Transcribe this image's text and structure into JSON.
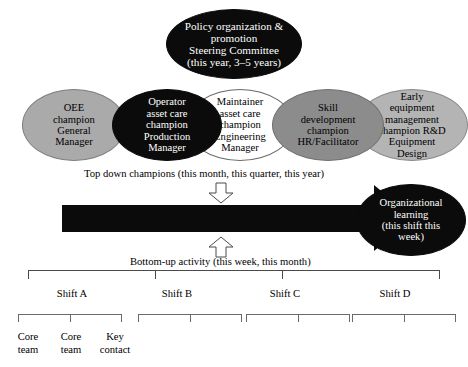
{
  "diagram": {
    "title_ellipse": {
      "label": "Policy organization & promotion Steering Committee (this year, 3–5 years)",
      "lines": [
        "Policy organization &",
        "promotion",
        "Steering Committee",
        "(this year, 3–5 years)"
      ],
      "fill": "#0b0b0b",
      "text_color": "#ffffff"
    },
    "champions": [
      {
        "name": "oee-champion",
        "lines": [
          "OEE",
          "champion",
          "General",
          "Manager"
        ],
        "fill": "#aaaaaa",
        "text_color": "#000000"
      },
      {
        "name": "operator-asset-care-champion",
        "lines": [
          "Operator",
          "asset care",
          "champion",
          "Production",
          "Manager"
        ],
        "fill": "#0b0b0b",
        "text_color": "#ffffff"
      },
      {
        "name": "maintainer-asset-care-champion",
        "lines": [
          "Maintainer",
          "asset care",
          "champion",
          "Engineering",
          "Manager"
        ],
        "fill": "#ffffff",
        "text_color": "#000000"
      },
      {
        "name": "skill-development-champion",
        "lines": [
          "Skill",
          "development",
          "champion",
          "HR/Facilitator"
        ],
        "fill": "#8c8c8c",
        "text_color": "#000000"
      },
      {
        "name": "early-equipment-management-champion",
        "lines": [
          "Early",
          "equipment",
          "management",
          "champion R&D",
          "Equipment",
          "Design"
        ],
        "fill": "#b4b4b4",
        "text_color": "#000000"
      }
    ],
    "top_down_caption": "Top down champions (this month, this quarter, this year)",
    "bottom_up_caption": "Bottom-up activity (this week, this month)",
    "organizational_learning": {
      "lines": [
        "Organizational",
        "learning",
        "(this shift this",
        "week)"
      ],
      "fill": "#0b0b0b",
      "text_color": "#ffffff"
    },
    "arrow_color": "#0b0b0b",
    "shifts": [
      {
        "label": "Shift A",
        "members": [
          "Core team",
          "Core team",
          "Key contact"
        ]
      },
      {
        "label": "Shift B",
        "members": []
      },
      {
        "label": "Shift C",
        "members": []
      },
      {
        "label": "Shift D",
        "members": []
      }
    ],
    "shift_a_members": [
      {
        "lines": [
          "Core",
          "team"
        ]
      },
      {
        "lines": [
          "Core",
          "team"
        ]
      },
      {
        "lines": [
          "Key",
          "contact"
        ]
      }
    ]
  }
}
